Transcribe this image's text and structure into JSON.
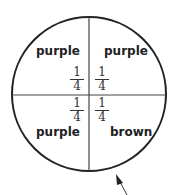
{
  "diagram": {
    "type": "spinner",
    "sections": [
      {
        "position": "top-left",
        "color_label": "purple",
        "fraction": {
          "numerator": "1",
          "denominator": "4"
        }
      },
      {
        "position": "top-right",
        "color_label": "purple",
        "fraction": {
          "numerator": "1",
          "denominator": "4"
        }
      },
      {
        "position": "bottom-left",
        "color_label": "purple",
        "fraction": {
          "numerator": "1",
          "denominator": "4"
        }
      },
      {
        "position": "bottom-right",
        "color_label": "brown",
        "fraction": {
          "numerator": "1",
          "denominator": "4"
        }
      }
    ],
    "pointer": "arrow"
  }
}
